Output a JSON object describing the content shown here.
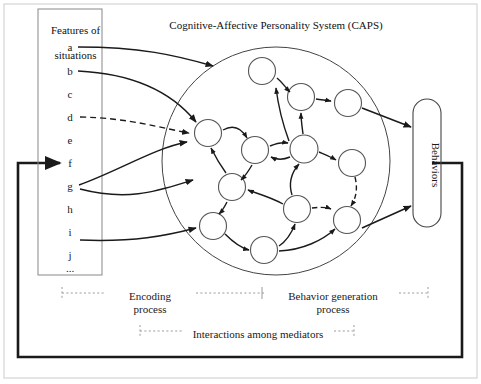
{
  "figure": {
    "caps_title": "Cognitive-Affective Personality System (CAPS)",
    "features_box": {
      "title_line1": "Features of",
      "title_line2": "situations",
      "items": [
        "a",
        "b",
        "c",
        "d",
        "e",
        "f",
        "g",
        "h",
        "i",
        "j",
        "..."
      ]
    },
    "behaviors_box": {
      "label": "Behaviors"
    },
    "process_labels": {
      "encoding_line1": "Encoding",
      "encoding_line2": "process",
      "behavior_generation_line1": "Behavior generation",
      "behavior_generation_line2": "process",
      "interactions": "Interactions among mediators"
    },
    "colors": {
      "stroke": "#1a1a1a",
      "node_stroke": "#555555",
      "box_stroke": "#808080",
      "dotted": "#9a9a9a",
      "background": "#ffffff"
    }
  },
  "diagram_data": {
    "type": "diagram",
    "mediating_units_count": 12,
    "situation_inputs": [
      "a",
      "b",
      "d",
      "g",
      "g",
      "j"
    ],
    "dashed_link_from": "d",
    "feedback_loop": "Behaviors back to Features of situations"
  }
}
